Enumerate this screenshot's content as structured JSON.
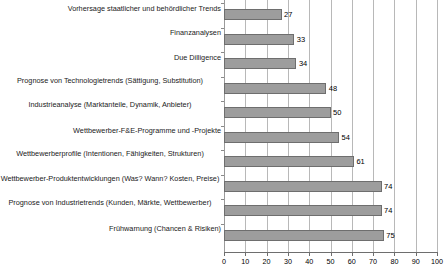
{
  "chart_data": {
    "type": "bar",
    "orientation": "horizontal",
    "title": "",
    "xlabel": "",
    "ylabel": "",
    "xlim": [
      0,
      100
    ],
    "xticks": [
      "0",
      "10",
      "20",
      "30",
      "40",
      "50",
      "60",
      "70",
      "80",
      "90",
      "100"
    ],
    "grid": true,
    "legend": "none",
    "bar_color": "#9d9d9d",
    "bar_border_color": "#6e6e6e",
    "gridline_color": "#b8b8b8",
    "background_color": "#ffffff",
    "categories": [
      "Vorhersage staatlicher und behördlicher Trends",
      "Finanzanalysen",
      "Due Dilligence",
      "Prognose von Technologietrends (Sättigung, Substitution)",
      "Industrieanalyse (Marktanteile, Dynamik, Anbieter)",
      "Wettbewerber-F&E-Programme und -Projekte",
      "Wettbewerberprofile (Intentionen, Fähigkeiten, Strukturen)",
      "Wettbewerber-Produktentwicklungen (Was? Wann? Kosten, Preise)",
      "Prognose von Industrietrends (Kunden, Märkte, Wettbewerber)",
      "Frühwarnung (Chancen & Risiken)"
    ],
    "values": [
      27,
      33,
      34,
      48,
      50,
      54,
      61,
      74,
      74,
      75
    ],
    "value_labels": [
      "27",
      "33",
      "34",
      "48",
      "50",
      "54",
      "61",
      "74",
      "74",
      "75"
    ]
  }
}
